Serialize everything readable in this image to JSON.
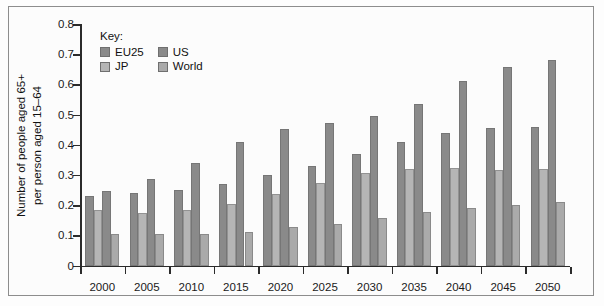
{
  "chart_data": {
    "type": "bar",
    "title": "",
    "subtitle": "",
    "xlabel": "",
    "ylabel": "Number of people aged 65+ per person aged 15-64",
    "ylabel_line1": "Number of people aged 65+",
    "ylabel_line2": "per person aged 15–64",
    "categories": [
      "2000",
      "2005",
      "2010",
      "2015",
      "2020",
      "2025",
      "2030",
      "2035",
      "2040",
      "2045",
      "2050"
    ],
    "series": [
      {
        "name": "EU25",
        "color": "#8a8a8a",
        "values": [
          0.23,
          0.24,
          0.25,
          0.27,
          0.3,
          0.33,
          0.37,
          0.41,
          0.44,
          0.455,
          0.46
        ]
      },
      {
        "name": "JP",
        "color": "#b5b5b5",
        "values": [
          0.185,
          0.175,
          0.183,
          0.205,
          0.236,
          0.273,
          0.306,
          0.32,
          0.322,
          0.317,
          0.32
        ]
      },
      {
        "name": "US",
        "color": "#8a8a8a",
        "values": [
          0.247,
          0.288,
          0.339,
          0.409,
          0.452,
          0.473,
          0.496,
          0.536,
          0.61,
          0.657,
          0.681
        ]
      },
      {
        "name": "World",
        "color": "#aaaaaa",
        "values": [
          0.104,
          0.104,
          0.104,
          0.112,
          0.129,
          0.139,
          0.157,
          0.177,
          0.191,
          0.202,
          0.211
        ]
      }
    ],
    "ylim": [
      0,
      0.8
    ],
    "yticks": [
      "0",
      "0.1",
      "0.2",
      "0.3",
      "0.4",
      "0.5",
      "0.6",
      "0.7",
      "0.8"
    ],
    "ytick_values": [
      0,
      0.1,
      0.2,
      0.3,
      0.4,
      0.5,
      0.6,
      0.7,
      0.8
    ],
    "grid": false,
    "legend_position": "top-left-inside",
    "legend_title": "Key:"
  },
  "legend": {
    "title": "Key:",
    "items": [
      {
        "label": "EU25",
        "color": "#8a8a8a"
      },
      {
        "label": "US",
        "color": "#8a8a8a"
      },
      {
        "label": "JP",
        "color": "#b5b5b5"
      },
      {
        "label": "World",
        "color": "#aaaaaa"
      }
    ]
  },
  "colors": {
    "axis": "#2b2b2b",
    "text": "#111111",
    "background": "#fcfcfc",
    "frame": "#8d8d8d",
    "bar_dark": "#8a8a8a",
    "bar_light": "#b5b5b5",
    "bar_world": "#aaaaaa"
  }
}
